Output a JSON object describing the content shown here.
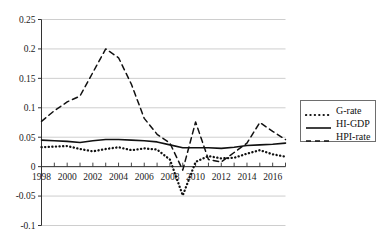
{
  "chart_data": {
    "type": "line",
    "title": "",
    "xlabel": "",
    "ylabel": "",
    "xlim": [
      1998,
      2017
    ],
    "ylim": [
      -0.1,
      0.25
    ],
    "grid": true,
    "grid_axis": "y",
    "legend_position": "right-outside",
    "y_ticks": [
      "0.25",
      "0.2",
      "0.15",
      "0.1",
      "0.05",
      "0",
      "-0.05",
      "-0.1"
    ],
    "y_tick_values": [
      0.25,
      0.2,
      0.15,
      0.1,
      0.05,
      0,
      -0.05,
      -0.1
    ],
    "x_ticks": [
      "1998",
      "2000",
      "2002",
      "2004",
      "2006",
      "2008",
      "2010",
      "2012",
      "2014",
      "2016"
    ],
    "x_tick_values": [
      1998,
      2000,
      2002,
      2004,
      2006,
      2008,
      2010,
      2012,
      2014,
      2016
    ],
    "x_minor_step": 1,
    "x": [
      1998,
      1999,
      2000,
      2001,
      2002,
      2003,
      2004,
      2005,
      2006,
      2007,
      2008,
      2009,
      2010,
      2011,
      2012,
      2013,
      2014,
      2015,
      2016,
      2017
    ],
    "series": [
      {
        "name": "G-rate",
        "style": "dotted",
        "color": "#111111",
        "values": [
          0.033,
          0.034,
          0.035,
          0.03,
          0.026,
          0.03,
          0.033,
          0.028,
          0.031,
          0.029,
          0.012,
          -0.049,
          0.008,
          0.018,
          0.014,
          0.015,
          0.022,
          0.028,
          0.021,
          0.017
        ]
      },
      {
        "name": "HI-GDP",
        "style": "solid",
        "color": "#111111",
        "values": [
          0.045,
          0.044,
          0.043,
          0.041,
          0.044,
          0.046,
          0.046,
          0.045,
          0.044,
          0.042,
          0.037,
          0.032,
          0.032,
          0.032,
          0.031,
          0.033,
          0.036,
          0.037,
          0.038,
          0.04
        ]
      },
      {
        "name": "HPI-rate",
        "style": "dashed",
        "color": "#111111",
        "values": [
          0.077,
          0.095,
          0.11,
          0.12,
          0.16,
          0.2,
          0.185,
          0.14,
          0.082,
          0.055,
          0.04,
          -0.006,
          0.076,
          0.012,
          0.008,
          0.024,
          0.04,
          0.075,
          0.06,
          0.046
        ]
      }
    ]
  },
  "legend": {
    "items": [
      {
        "label": "G-rate",
        "style": "dotted"
      },
      {
        "label": "HI-GDP",
        "style": "solid"
      },
      {
        "label": "HPI-rate",
        "style": "dashed"
      }
    ]
  }
}
